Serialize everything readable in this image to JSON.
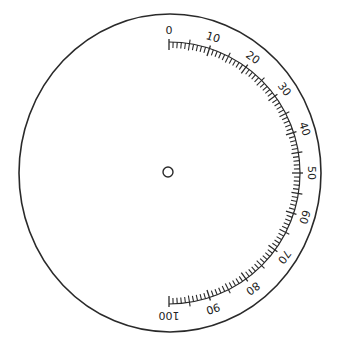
{
  "diagram": {
    "type": "circular-dial-scale",
    "colors": {
      "stroke": "#2a2a2a",
      "background": "#ffffff"
    },
    "outer_circle": {
      "cx": 170,
      "cy": 173,
      "rx": 151,
      "ry": 159
    },
    "center_mark": {
      "cx": 168,
      "cy": 172,
      "r": 5
    },
    "scale": {
      "cx": 169,
      "cy": 173,
      "radius": 131,
      "start_angle_deg": 0,
      "end_angle_deg": 180,
      "min": 0,
      "max": 100,
      "minor_step": 1,
      "medium_step": 5,
      "major_step": 10,
      "labels": [
        "0",
        "10",
        "20",
        "30",
        "40",
        "50",
        "60",
        "70",
        "80",
        "90",
        "100"
      ]
    }
  }
}
